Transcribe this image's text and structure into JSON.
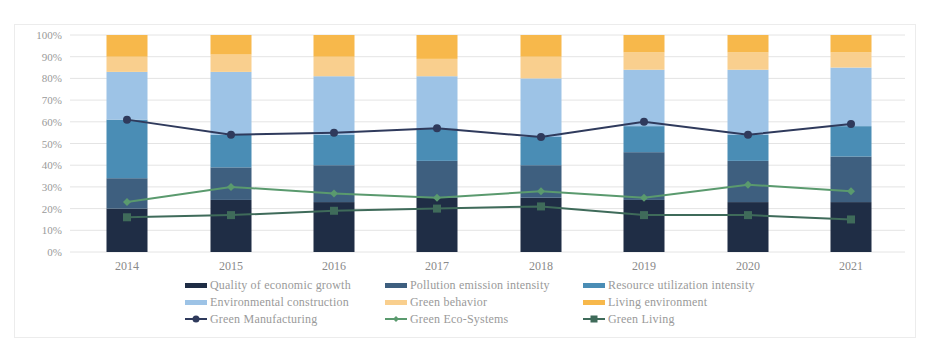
{
  "chart_data": {
    "type": "bar",
    "subtype": "stacked-100-percent-bar-with-line-overlay",
    "title": "",
    "xlabel": "",
    "ylabel": "",
    "ylim": [
      0,
      100
    ],
    "y_ticks": [
      "0%",
      "10%",
      "20%",
      "30%",
      "40%",
      "50%",
      "60%",
      "70%",
      "80%",
      "90%",
      "100%"
    ],
    "grid": true,
    "legend_position": "bottom",
    "categories": [
      "2014",
      "2015",
      "2016",
      "2017",
      "2018",
      "2019",
      "2020",
      "2021"
    ],
    "series": [
      {
        "name": "Quality of economic growth",
        "type": "bar",
        "color": "#1f2d45",
        "values": [
          20,
          24,
          23,
          25,
          25,
          24,
          23,
          23
        ]
      },
      {
        "name": "Pollution emission intensity",
        "type": "bar",
        "color": "#3e5f7f",
        "values": [
          14,
          15,
          17,
          17,
          15,
          22,
          19,
          21
        ]
      },
      {
        "name": "Resource utilization intensity",
        "type": "bar",
        "color": "#4a8db5",
        "values": [
          27,
          15,
          14,
          15,
          13,
          12,
          12,
          14
        ]
      },
      {
        "name": "Environmental construction",
        "type": "bar",
        "color": "#9dc3e6",
        "values": [
          22,
          29,
          27,
          24,
          27,
          26,
          30,
          27
        ]
      },
      {
        "name": "Green behavior",
        "type": "bar",
        "color": "#f9cf8e",
        "values": [
          7,
          8,
          9,
          8,
          10,
          8,
          8,
          7
        ]
      },
      {
        "name": "Living environment",
        "type": "bar",
        "color": "#f7b84b",
        "values": [
          10,
          9,
          10,
          11,
          10,
          8,
          8,
          8
        ]
      },
      {
        "name": "Green Manufacturing",
        "type": "line",
        "marker": "circle",
        "color": "#2f3a5c",
        "values": [
          61,
          54,
          55,
          57,
          53,
          60,
          54,
          59
        ]
      },
      {
        "name": "Green Eco-Systems",
        "type": "line",
        "marker": "diamond",
        "color": "#5a9a6e",
        "values": [
          23,
          30,
          27,
          25,
          28,
          25,
          31,
          28
        ]
      },
      {
        "name": "Green Living",
        "type": "line",
        "marker": "square",
        "color": "#3f6b5a",
        "values": [
          16,
          17,
          19,
          20,
          21,
          17,
          17,
          15
        ]
      }
    ]
  },
  "legend": {
    "rows": [
      [
        {
          "label": "Quality of economic growth",
          "kind": "bar",
          "color": "#1f2d45"
        },
        {
          "label": "Pollution emission intensity",
          "kind": "bar",
          "color": "#3e5f7f"
        },
        {
          "label": "Resource utilization intensity",
          "kind": "bar",
          "color": "#4a8db5"
        }
      ],
      [
        {
          "label": "Environmental construction",
          "kind": "bar",
          "color": "#9dc3e6"
        },
        {
          "label": "Green behavior",
          "kind": "bar",
          "color": "#f9cf8e"
        },
        {
          "label": "Living environment",
          "kind": "bar",
          "color": "#f7b84b"
        }
      ],
      [
        {
          "label": "Green Manufacturing",
          "kind": "line",
          "marker": "circle",
          "color": "#2f3a5c"
        },
        {
          "label": "Green Eco-Systems",
          "kind": "line",
          "marker": "diamond",
          "color": "#5a9a6e"
        },
        {
          "label": "Green Living",
          "kind": "line",
          "marker": "square",
          "color": "#3f6b5a"
        }
      ]
    ]
  }
}
